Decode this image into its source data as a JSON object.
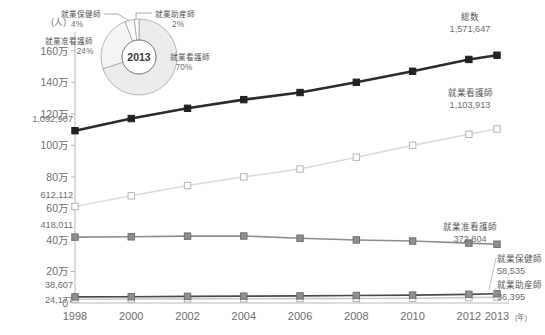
{
  "chart_data": {
    "type": "line",
    "title": "",
    "xlabel": "年",
    "ylabel": "人",
    "x": [
      "1998",
      "2000",
      "2002",
      "2004",
      "2006",
      "2008",
      "2010",
      "2012",
      "2013"
    ],
    "ylim": [
      0,
      1700000
    ],
    "yticks": [
      0,
      200000,
      400000,
      600000,
      800000,
      1000000,
      1200000,
      1400000,
      1600000
    ],
    "ytick_labels": [
      "0",
      "20万",
      "40万",
      "60万",
      "80万",
      "100万",
      "120万",
      "140万",
      "160万"
    ],
    "grid": false,
    "legend_position": "inline-end-labels",
    "series": [
      {
        "name": "総数",
        "color": "#2b2b2d",
        "marker": "filled-square",
        "values": [
          1092907,
          1170000,
          1235000,
          1290000,
          1335000,
          1400000,
          1470000,
          1545000,
          1571647
        ],
        "start_label": "1,092,907",
        "end_label": "1,571,647"
      },
      {
        "name": "就業看護師",
        "color": "#dcdcdc",
        "marker": "open-square",
        "values": [
          612112,
          680000,
          745000,
          800000,
          850000,
          925000,
          1000000,
          1070000,
          1103913
        ],
        "start_label": "612,112",
        "end_label": "1,103,913"
      },
      {
        "name": "就業准看護師",
        "color": "#8d8d90",
        "marker": "gray-square",
        "values": [
          418011,
          420000,
          424000,
          425000,
          411000,
          400000,
          393000,
          380000,
          372804
        ],
        "start_label": "418,011",
        "end_label": "372,804"
      },
      {
        "name": "就業保健師",
        "color": "#4a4a4c",
        "marker": "gray-square",
        "values": [
          38607,
          40000,
          42000,
          43500,
          45000,
          47500,
          50000,
          55000,
          58535
        ],
        "start_label": "38,607",
        "end_label": "58,535"
      },
      {
        "name": "就業助産師",
        "color": "#c9c9cb",
        "marker": "open-square",
        "values": [
          24177,
          25000,
          26000,
          27000,
          28000,
          29000,
          30000,
          34000,
          36395
        ],
        "start_label": "24,177",
        "end_label": "36,395"
      }
    ],
    "inset_pie": {
      "type": "pie",
      "center_label": "2013",
      "slices": [
        {
          "label": "就業看護師",
          "pct": "70%",
          "value": 70,
          "color": "#ececec"
        },
        {
          "label": "就業准看護師",
          "pct": "24%",
          "value": 24,
          "color": "#f4f4f4"
        },
        {
          "label": "就業保健師",
          "pct": "4%",
          "value": 4,
          "color": "#fafafa"
        },
        {
          "label": "就業助産師",
          "pct": "2%",
          "value": 2,
          "color": "#ffffff"
        }
      ]
    }
  },
  "axis": {
    "unit_y": "(人)",
    "unit_x": "(年)"
  }
}
